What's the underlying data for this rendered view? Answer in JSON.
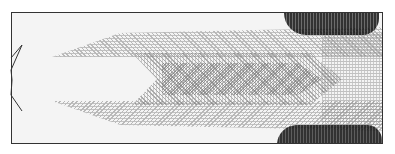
{
  "figure": {
    "type": "flow-field visualization",
    "colormap": "grayscale halftone",
    "frame_color": "#333333",
    "background": "#ffffff",
    "inlet_shape": "chevron star at left boundary",
    "dark_regions": [
      "upper-right wall",
      "lower-right wall"
    ]
  }
}
